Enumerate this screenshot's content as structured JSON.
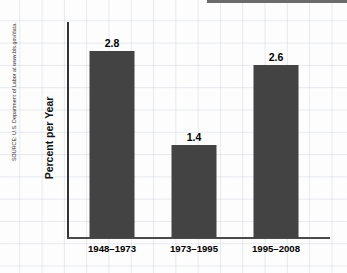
{
  "chart_data": {
    "type": "bar",
    "title": "",
    "subtitle": "",
    "xlabel": "",
    "ylabel": "Percent per Year",
    "categories": [
      "1948–1973",
      "1973–1995",
      "1995–2008"
    ],
    "values": [
      2.8,
      1.4,
      2.6
    ],
    "value_labels": [
      "2.8",
      "1.4",
      "2.6"
    ],
    "ylim": [
      0,
      3.0
    ],
    "grid": true,
    "grid_style": "graph-paper",
    "legend": null,
    "legend_position": "none",
    "series": [
      {
        "name": "Productivity growth",
        "values": [
          2.8,
          1.4,
          2.6
        ]
      }
    ],
    "annotations": [
      "SOURCE: U.S. Department of Labor at www.bls.gov/data."
    ],
    "bar_color": "#434343",
    "axis_color": "#333333",
    "grid_color": "#c8cdd7",
    "text_color": "#000000"
  },
  "chart": {
    "y_axis_title": "Percent per Year",
    "source_note": "SOURCE: U.S. Department of Labor at www.bls.gov/data.",
    "bars": [
      {
        "label": "1948–1973",
        "value_label": "2.8"
      },
      {
        "label": "1973–1995",
        "value_label": "1.4"
      },
      {
        "label": "1995–2008",
        "value_label": "2.6"
      }
    ]
  }
}
